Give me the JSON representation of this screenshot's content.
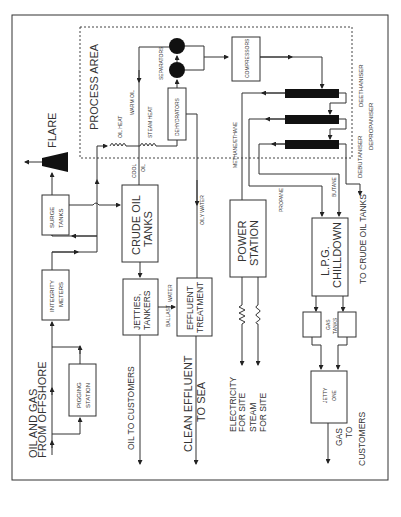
{
  "diagram": {
    "type": "process-flow",
    "orientation": "rotated-90-ccw",
    "process_area": {
      "label": "PROCESS AREA"
    },
    "nodes": {
      "flare": "FLARE",
      "surge_tanks": "SURGE TANKS",
      "surge_l1": "SURGE",
      "surge_l2": "TANKS",
      "integrity_l1": "INTEGRITY",
      "integrity_l2": "METERS",
      "pigging_l1": "PIGGING",
      "pigging_l2": "STATION",
      "crude_l1": "CRUDE OIL",
      "crude_l2": "TANKS",
      "jetties_l1": "JETTIES,",
      "jetties_l2": "TANKERS",
      "effluent_l1": "EFFLUENT",
      "effluent_l2": "TREATMENT",
      "power_l1": "POWER",
      "power_l2": "STATION",
      "lpg_l1": "L.P.G.",
      "lpg_l2": "CHILLDOWN",
      "gas_tanks_l1": "GAS",
      "gas_tanks_l2": "TANKS",
      "jetty_one_l1": "JETTY",
      "jetty_one_l2": "ONE",
      "dehydrators": "DEHYDRATORS",
      "separators": "SEPARATORS",
      "compressors": "COMPRESSORS",
      "deethaniser": "DEETHANISER",
      "depropaniser": "DEPROPANISER",
      "debutaniser": "DEBUTANISER"
    },
    "flow_labels": {
      "oil_heat": "OIL HEAT",
      "steam_heat": "STEAM HEAT",
      "warm_oil": "WARM OIL",
      "cool": "COOL",
      "oil": "OIL",
      "oily_water": "OILY WATER",
      "methane_ethane": "METHANE/ETHANE",
      "propane": "PROPANE",
      "butane": "BUTANE",
      "ballast": "BALLAST",
      "water": "WATER"
    },
    "outputs": {
      "offshore_l1": "OIL AND GAS",
      "offshore_l2": "FROM OFFSHORE",
      "oil_customers": "OIL TO CUSTOMERS",
      "effluent_l1": "CLEAN EFFLUENT",
      "effluent_l2": "TO SEA",
      "electricity_l1": "ELECTRICITY",
      "electricity_l2": "FOR SITE",
      "steam_l1": "STEAM",
      "steam_l2": "FOR SITE",
      "gas_l1": "GAS",
      "gas_l2": "TO",
      "gas_l3": "CUSTOMERS",
      "crude_return": "TO CRUDE OIL TANKS"
    }
  }
}
